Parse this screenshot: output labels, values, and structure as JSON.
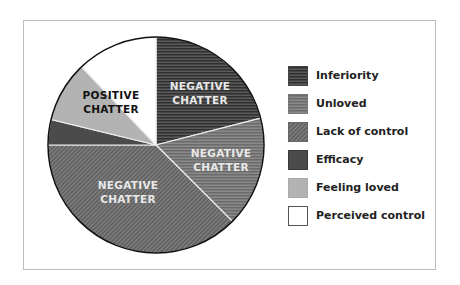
{
  "chart_data": {
    "type": "pie",
    "title": "",
    "start_angle_deg": 0,
    "direction": "clockwise",
    "slices": [
      {
        "label": "Inferiority",
        "value": 21.0,
        "group": "NEGATIVE CHATTER",
        "fill": "#4a4a4a",
        "pattern": "hstripes-dark"
      },
      {
        "label": "Unloved",
        "value": 16.5,
        "group": "NEGATIVE CHATTER",
        "fill": "#7a7a7a",
        "pattern": "hstripes-light"
      },
      {
        "label": "Lack of control",
        "value": 37.5,
        "group": "NEGATIVE CHATTER",
        "fill": "#6e6e6e",
        "pattern": "diagonal"
      },
      {
        "label": "Efficacy",
        "value": 3.8,
        "group": "POSITIVE CHATTER",
        "fill": "#4b4b4b",
        "pattern": "solid"
      },
      {
        "label": "Feeling loved",
        "value": 9.1,
        "group": "POSITIVE CHATTER",
        "fill": "#b3b3b3",
        "pattern": "solid"
      },
      {
        "label": "Perceived control",
        "value": 12.1,
        "group": "POSITIVE CHATTER",
        "fill": "#ffffff",
        "pattern": "solid"
      }
    ],
    "annotations": [
      {
        "text": [
          "NEGATIVE",
          "CHATTER"
        ],
        "slice": "Inferiority"
      },
      {
        "text": [
          "NEGATIVE",
          "CHATTER"
        ],
        "slice": "Unloved"
      },
      {
        "text": [
          "NEGATIVE",
          "CHATTER"
        ],
        "slice": "Lack of control"
      },
      {
        "text": [
          "POSITIVE",
          "CHATTER"
        ],
        "slice": "Feeling loved / Perceived control / Efficacy"
      }
    ],
    "legend_position": "right"
  },
  "labels": {
    "neg1": [
      "NEGATIVE",
      "CHATTER"
    ],
    "neg2": [
      "NEGATIVE",
      "CHATTER"
    ],
    "neg3": [
      "NEGATIVE",
      "CHATTER"
    ],
    "pos": [
      "POSITIVE",
      "CHATTER"
    ]
  },
  "legend": [
    {
      "label": "Inferiority"
    },
    {
      "label": "Unloved"
    },
    {
      "label": "Lack of control"
    },
    {
      "label": "Efficacy"
    },
    {
      "label": "Feeling loved"
    },
    {
      "label": "Perceived control"
    }
  ]
}
